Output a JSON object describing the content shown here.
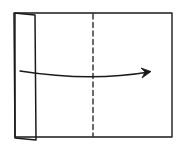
{
  "diagram": {
    "type": "folding-instruction",
    "elements": {
      "paper": "rectangular-sheet",
      "flap": "folded-left-strip",
      "fold_line": {
        "style": "dashed",
        "orientation": "vertical",
        "position": "center"
      },
      "arrow": {
        "direction": "right",
        "meaning": "fold-over"
      }
    },
    "colors": {
      "line": "#1a1a1a",
      "background": "#ffffff"
    }
  }
}
